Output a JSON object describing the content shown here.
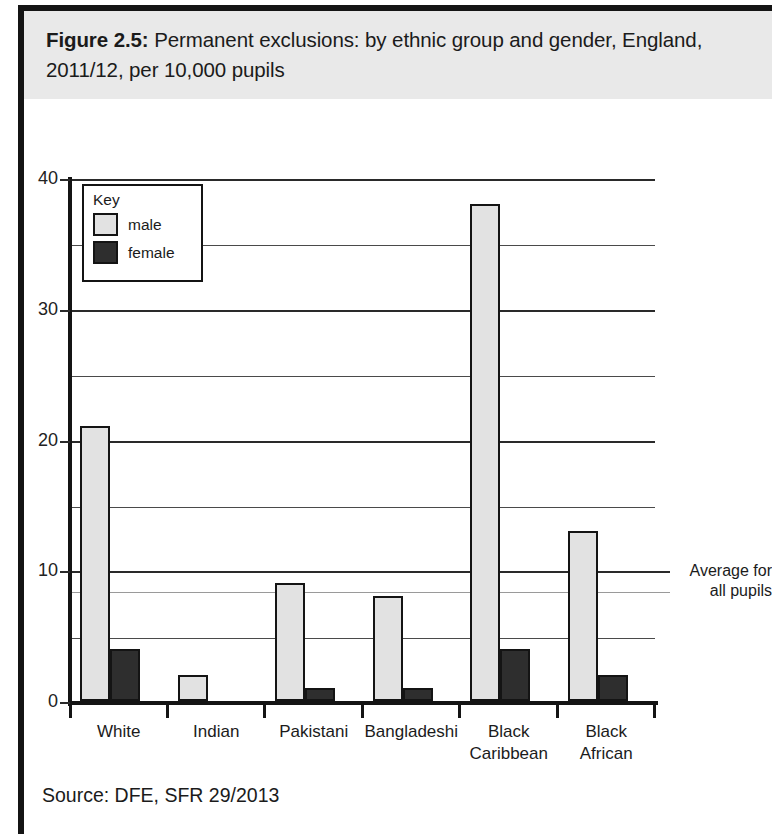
{
  "figure": {
    "label": "Figure 2.5:",
    "title": "Permanent exclusions: by ethnic group and gender, England, 2011/12, per 10,000 pupils",
    "source": "Source: DFE, SFR 29/2013"
  },
  "key": {
    "heading": "Key",
    "entries": [
      {
        "label": "male",
        "color": "#e2e2e2"
      },
      {
        "label": "female",
        "color": "#2e2e2e"
      }
    ]
  },
  "annotations": {
    "average_line": {
      "line1": "Average for",
      "line2": "all pupils",
      "value": 8.5
    }
  },
  "chart_data": {
    "type": "bar",
    "title": "Permanent exclusions: by ethnic group and gender, England, 2011/12, per 10,000 pupils",
    "xlabel": "",
    "ylabel": "",
    "categories": [
      "White",
      "Indian",
      "Pakistani",
      "Bangladeshi",
      "Black Caribbean",
      "Black African"
    ],
    "category_lines": [
      [
        "White"
      ],
      [
        "Indian"
      ],
      [
        "Pakistani"
      ],
      [
        "Bangladeshi"
      ],
      [
        "Black",
        "Caribbean"
      ],
      [
        "Black",
        "African"
      ]
    ],
    "series": [
      {
        "name": "male",
        "color": "#e2e2e2",
        "values": [
          21,
          2,
          9,
          8,
          38,
          13
        ]
      },
      {
        "name": "female",
        "color": "#2e2e2e",
        "values": [
          4,
          0,
          1,
          1,
          4,
          2
        ]
      }
    ],
    "ylim": [
      0,
      40
    ],
    "ymajor_ticks": [
      0,
      10,
      20,
      30,
      40
    ],
    "ymajor_tick_labels": [
      "0",
      "10",
      "20",
      "30",
      "40"
    ],
    "yminor_ticks": [
      5,
      15,
      25,
      35
    ],
    "grid": true,
    "legend_position": "upper-left",
    "reference_line": {
      "label": "Average for all pupils",
      "value": 8.5
    }
  }
}
